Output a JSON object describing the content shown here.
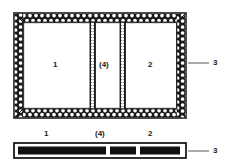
{
  "figure": {
    "type": "patent-technical-diagram",
    "background_color": "#ffffff",
    "ink_color": "#1b1b1b",
    "hatch_fill_color": "#181818",
    "hatch_dot_color": "#ffffff",
    "leader_color": "#555555"
  },
  "plan_view": {
    "name": "plan-view",
    "outer_frame": {
      "label": "hatched outer wall",
      "x": 14,
      "y": 13,
      "width": 172,
      "height": 105,
      "wall_thickness": 9
    },
    "compartments": [
      {
        "id": "c1",
        "label": "1",
        "x": 9,
        "y": 9,
        "width": 67,
        "height": 87
      },
      {
        "id": "c4",
        "label": "(4)",
        "x": 85,
        "y": 9,
        "width": 21,
        "height": 87
      },
      {
        "id": "c2",
        "label": "2",
        "x": 115,
        "y": 9,
        "width": 48,
        "height": 87
      }
    ],
    "dividers": [
      {
        "id": "d1",
        "x": 76,
        "y": 9,
        "width": 9,
        "height": 87
      },
      {
        "id": "d2",
        "x": 106,
        "y": 9,
        "width": 9,
        "height": 87
      }
    ],
    "callout": {
      "label": "3",
      "label_x": 214,
      "label_y": 59,
      "leader_from_x": 188,
      "leader_to_x": 209,
      "leader_y": 63
    }
  },
  "section_view": {
    "name": "section-view",
    "strip": {
      "x": 14,
      "y": 143,
      "width": 172,
      "height": 15
    },
    "segments": [
      {
        "id": "s1",
        "label": "1",
        "x": 4,
        "width": 88,
        "label_x": 44,
        "label_y": 131
      },
      {
        "id": "s4",
        "label": "(4)",
        "x": 96,
        "width": 26,
        "label_x": 104,
        "label_y": 131
      },
      {
        "id": "s2",
        "label": "2",
        "x": 126,
        "width": 80,
        "label_x": 148,
        "label_y": 131
      }
    ],
    "callout": {
      "label": "3",
      "label_x": 214,
      "label_y": 147,
      "leader_from_x": 188,
      "leader_to_x": 209,
      "leader_y": 151
    }
  },
  "labels": {
    "compartment_one": "1",
    "compartment_two": "2",
    "compartment_four": "(4)",
    "wall_callout": "3"
  }
}
